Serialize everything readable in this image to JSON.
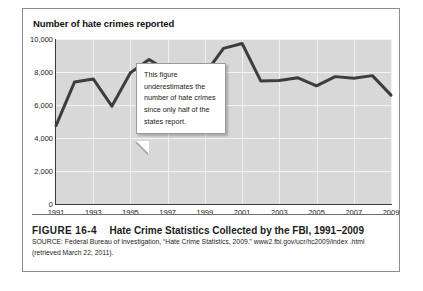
{
  "figure": {
    "number": "FIGURE 16-4",
    "caption": "Hate Crime Statistics Collected by the FBI, 1991–2009",
    "source": "SOURCE: Federal Bureau of Investigation, “Hate Crime Statistics, 2009.” www2.fbi.gov/ucr/hc2009/index .html (retrieved March 22, 2011)."
  },
  "callout": {
    "text": "This figure underestimates the number of hate crimes since only half of the states report."
  },
  "chart_data": {
    "type": "line",
    "title": "Number of hate crimes reported",
    "xlabel": "",
    "ylabel": "Number of hate crimes reported",
    "ylim": [
      0,
      10000
    ],
    "yticks": [
      0,
      2000,
      4000,
      6000,
      8000,
      10000
    ],
    "ytick_labels": [
      "0",
      "2,000",
      "4,000",
      "6,000",
      "8,000",
      "10,000"
    ],
    "xlim": [
      1991,
      2009
    ],
    "xticks": [
      1991,
      1993,
      1995,
      1997,
      1999,
      2001,
      2003,
      2005,
      2007,
      2009
    ],
    "xtick_labels": [
      "1991",
      "1993",
      "1995",
      "1997",
      "1999",
      "2001",
      "2003",
      "2005",
      "2007",
      "2009"
    ],
    "grid": true,
    "legend": false,
    "line_color": "#3d3d3d",
    "plot_background": "#d8d8d8",
    "x": [
      1991,
      1992,
      1993,
      1994,
      1995,
      1996,
      1997,
      1998,
      1999,
      2000,
      2001,
      2002,
      2003,
      2004,
      2005,
      2006,
      2007,
      2008,
      2009
    ],
    "values": [
      4755,
      7400,
      7580,
      5930,
      7950,
      8760,
      8060,
      7760,
      7880,
      9430,
      9730,
      7460,
      7490,
      7650,
      7160,
      7720,
      7620,
      7780,
      6600
    ],
    "series": [
      {
        "name": "Hate crimes reported",
        "values": [
          4755,
          7400,
          7580,
          5930,
          7950,
          8760,
          8060,
          7760,
          7880,
          9430,
          9730,
          7460,
          7490,
          7650,
          7160,
          7720,
          7620,
          7780,
          6600
        ]
      }
    ]
  }
}
